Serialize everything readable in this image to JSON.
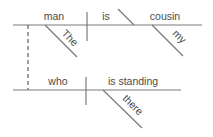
{
  "diagram": {
    "type": "sentence-diagram",
    "main_clause": {
      "subject": "man",
      "verb": "is",
      "complement": "cousin",
      "subject_modifier": "The",
      "complement_modifier": "my"
    },
    "relative_clause": {
      "subject": "who",
      "verb": "is standing",
      "adverb": "there"
    },
    "colors": {
      "line": "#7a7a7a",
      "text": "#4a4a4a",
      "background": "#ffffff"
    }
  }
}
